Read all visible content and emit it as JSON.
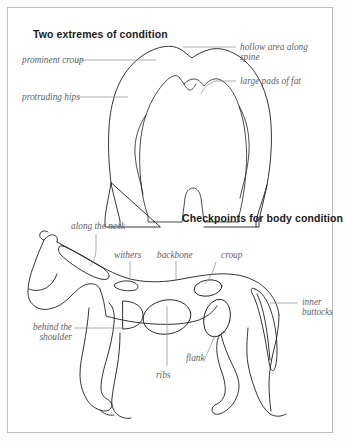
{
  "page": {
    "border_color": "#b9bcc0",
    "background": "#ffffff",
    "ink_color": "#1d1d1d",
    "leader_color": "#8e9195",
    "label_color": "#5d6166"
  },
  "panel_top": {
    "heading": "Two extremes of condition",
    "diagram_name": "horse-hindquarters-rear-view",
    "labels": [
      {
        "id": "prominent-croup",
        "text": "prominent croup"
      },
      {
        "id": "protruding-hips",
        "text": "protruding hips"
      },
      {
        "id": "hollow-area-spine",
        "text": "hollow area along"
      },
      {
        "id": "hollow-area-spine-line2",
        "text": "spine"
      },
      {
        "id": "large-pads-of-fat",
        "text": "large pads of fat"
      }
    ]
  },
  "panel_bottom": {
    "heading": "Checkpoints for body condition",
    "diagram_name": "horse-side-profile",
    "labels": [
      {
        "id": "along-the-neck",
        "text": "along the neck"
      },
      {
        "id": "withers",
        "text": "withers"
      },
      {
        "id": "backbone",
        "text": "backbone"
      },
      {
        "id": "croup",
        "text": "croup"
      },
      {
        "id": "inner-buttocks-1",
        "text": "inner"
      },
      {
        "id": "inner-buttocks-2",
        "text": "buttocks"
      },
      {
        "id": "behind-shoulder-1",
        "text": "behind the"
      },
      {
        "id": "behind-shoulder-2",
        "text": "shoulder"
      },
      {
        "id": "ribs",
        "text": "ribs"
      },
      {
        "id": "flank",
        "text": "flank"
      }
    ]
  }
}
